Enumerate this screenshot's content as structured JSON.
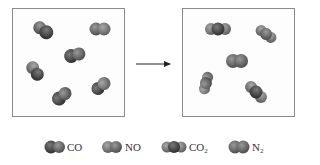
{
  "diagram": {
    "type": "reaction-scheme",
    "left_box": {
      "label": "reactants",
      "molecules": [
        "CO",
        "NO",
        "CO",
        "NO",
        "CO",
        "NO"
      ]
    },
    "right_box": {
      "label": "products",
      "molecules": [
        "CO2",
        "CO2",
        "N2",
        "CO2",
        "CO2"
      ]
    },
    "arrow": "reaction-arrow",
    "colors": {
      "dark_atom": "#4a4a4a",
      "mid_atom": "#6e6e6e",
      "light_atom": "#8c8c8c",
      "border": "#8a8a8a"
    }
  },
  "legend": {
    "items": [
      {
        "name": "CO",
        "text": "CO",
        "sub": ""
      },
      {
        "name": "NO",
        "text": "NO",
        "sub": ""
      },
      {
        "name": "CO2",
        "text": "CO",
        "sub": "2"
      },
      {
        "name": "N2",
        "text": "N",
        "sub": "2"
      }
    ]
  }
}
